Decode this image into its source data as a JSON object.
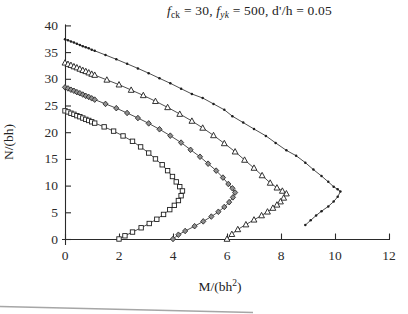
{
  "chart_data": {
    "type": "line",
    "title_plain": "fck = 30, fyk = 500, d'/h = 0.05",
    "title_segments": [
      {
        "text": "f",
        "italic": true
      },
      {
        "text": "ck",
        "sub": true
      },
      {
        "text": " = 30, "
      },
      {
        "text": "f",
        "italic": true
      },
      {
        "text": "yk",
        "sub": true,
        "italic": true
      },
      {
        "text": " = 500, d'/h = 0.05"
      }
    ],
    "ylabel": "N/(bh)",
    "xlabel_plain": "M/(bh2)",
    "xlabel_segments": [
      {
        "text": "M/(bh"
      },
      {
        "text": "2",
        "sup": true
      },
      {
        "text": ")"
      }
    ],
    "xlim": [
      0,
      12
    ],
    "ylim": [
      0,
      40
    ],
    "xticks": [
      0,
      2,
      4,
      6,
      8,
      10,
      12
    ],
    "yticks": [
      0,
      5,
      10,
      15,
      20,
      25,
      30,
      35,
      40
    ],
    "grid": false,
    "legend": "none",
    "axis_color": "#2a2a2a",
    "line_color": "#3a3a3a",
    "marker_outline": "#1e1e1e",
    "marker_fill_open": "#ffffff",
    "marker_fill_gray": "#8f8f8f",
    "series": [
      {
        "id": "curve-1",
        "marker": "square",
        "points": [
          [
            0,
            24
          ],
          [
            0.11,
            23.8
          ],
          [
            0.22,
            23.55
          ],
          [
            0.33,
            23.35
          ],
          [
            0.44,
            23.1
          ],
          [
            0.55,
            22.9
          ],
          [
            0.66,
            22.65
          ],
          [
            0.77,
            22.4
          ],
          [
            0.88,
            22.2
          ],
          [
            0.99,
            21.95
          ],
          [
            1.1,
            21.7
          ],
          [
            1.45,
            21
          ],
          [
            1.8,
            20.2
          ],
          [
            2.15,
            19.3
          ],
          [
            2.5,
            18.3
          ],
          [
            2.8,
            17.25
          ],
          [
            3.1,
            16.1
          ],
          [
            3.35,
            15
          ],
          [
            3.6,
            13.9
          ],
          [
            3.8,
            12.8
          ],
          [
            3.98,
            11.7
          ],
          [
            4.12,
            10.7
          ],
          [
            4.25,
            9.8
          ],
          [
            4.35,
            9
          ],
          [
            4.3,
            8.1
          ],
          [
            4.2,
            7.2
          ],
          [
            4.05,
            6.3
          ],
          [
            3.88,
            5.5
          ],
          [
            3.65,
            4.6
          ],
          [
            3.4,
            3.7
          ],
          [
            3.12,
            2.9
          ],
          [
            2.82,
            2.1
          ],
          [
            2.5,
            1.3
          ],
          [
            2.22,
            0.6
          ],
          [
            2,
            0
          ]
        ]
      },
      {
        "id": "curve-2",
        "marker": "diamond",
        "points": [
          [
            0,
            28.4
          ],
          [
            0.11,
            28.2
          ],
          [
            0.22,
            27.95
          ],
          [
            0.33,
            27.75
          ],
          [
            0.44,
            27.5
          ],
          [
            0.55,
            27.3
          ],
          [
            0.66,
            27.05
          ],
          [
            0.77,
            26.8
          ],
          [
            0.88,
            26.6
          ],
          [
            0.99,
            26.35
          ],
          [
            1.1,
            26.1
          ],
          [
            1.5,
            25.3
          ],
          [
            1.9,
            24.5
          ],
          [
            2.3,
            23.6
          ],
          [
            2.7,
            22.65
          ],
          [
            3.1,
            21.65
          ],
          [
            3.5,
            20.55
          ],
          [
            3.9,
            19.35
          ],
          [
            4.3,
            18.05
          ],
          [
            4.65,
            16.7
          ],
          [
            5,
            15.4
          ],
          [
            5.3,
            14.1
          ],
          [
            5.6,
            12.8
          ],
          [
            5.85,
            11.5
          ],
          [
            6.05,
            10.3
          ],
          [
            6.2,
            9.5
          ],
          [
            6.3,
            8.7
          ],
          [
            6.22,
            7.8
          ],
          [
            6.08,
            6.9
          ],
          [
            5.9,
            6
          ],
          [
            5.68,
            5.1
          ],
          [
            5.42,
            4.2
          ],
          [
            5.12,
            3.3
          ],
          [
            4.8,
            2.4
          ],
          [
            4.45,
            1.5
          ],
          [
            4.2,
            0.8
          ],
          [
            4,
            0
          ]
        ]
      },
      {
        "id": "curve-3",
        "marker": "triangle",
        "points": [
          [
            0,
            33
          ],
          [
            0.11,
            32.75
          ],
          [
            0.22,
            32.55
          ],
          [
            0.33,
            32.3
          ],
          [
            0.44,
            32.1
          ],
          [
            0.55,
            31.85
          ],
          [
            0.66,
            31.6
          ],
          [
            0.77,
            31.4
          ],
          [
            0.88,
            31.15
          ],
          [
            0.99,
            30.9
          ],
          [
            1.1,
            30.7
          ],
          [
            1.55,
            29.8
          ],
          [
            2,
            28.9
          ],
          [
            2.45,
            27.9
          ],
          [
            2.9,
            26.9
          ],
          [
            3.35,
            25.8
          ],
          [
            3.8,
            24.65
          ],
          [
            4.25,
            23.4
          ],
          [
            4.7,
            22.1
          ],
          [
            5.1,
            20.8
          ],
          [
            5.5,
            19.4
          ],
          [
            5.9,
            17.9
          ],
          [
            6.3,
            16.35
          ],
          [
            6.65,
            14.8
          ],
          [
            7,
            13.3
          ],
          [
            7.3,
            11.9
          ],
          [
            7.6,
            10.5
          ],
          [
            7.85,
            9.6
          ],
          [
            8.05,
            9
          ],
          [
            8.2,
            8.5
          ],
          [
            8.1,
            7.7
          ],
          [
            7.98,
            7
          ],
          [
            7.85,
            6.4
          ],
          [
            7.7,
            5.8
          ],
          [
            7.5,
            5.1
          ],
          [
            7.28,
            4.4
          ],
          [
            7,
            3.6
          ],
          [
            6.7,
            2.7
          ],
          [
            6.4,
            1.8
          ],
          [
            6.18,
            0.9
          ],
          [
            6,
            0
          ]
        ]
      },
      {
        "id": "curve-4",
        "marker": "dot",
        "points": [
          [
            0,
            37.4
          ],
          [
            0.11,
            37.2
          ],
          [
            0.22,
            37
          ],
          [
            0.33,
            36.8
          ],
          [
            0.44,
            36.55
          ],
          [
            0.55,
            36.35
          ],
          [
            0.66,
            36.1
          ],
          [
            0.77,
            35.9
          ],
          [
            0.88,
            35.7
          ],
          [
            0.99,
            35.45
          ],
          [
            1.1,
            35.25
          ],
          [
            1.5,
            34.45
          ],
          [
            1.9,
            33.65
          ],
          [
            2.3,
            32.8
          ],
          [
            2.7,
            31.95
          ],
          [
            3.1,
            31.05
          ],
          [
            3.5,
            30.1
          ],
          [
            3.9,
            29.15
          ],
          [
            4.3,
            28.15
          ],
          [
            4.7,
            27.15
          ],
          [
            5.1,
            26.4
          ],
          [
            5.5,
            25.3
          ],
          [
            5.9,
            24.2
          ],
          [
            6.2,
            23
          ],
          [
            6.6,
            21.8
          ],
          [
            7,
            20.6
          ],
          [
            7.44,
            19.3
          ],
          [
            7.8,
            18
          ],
          [
            8.2,
            16.6
          ],
          [
            8.56,
            15.6
          ],
          [
            8.9,
            14.3
          ],
          [
            9.2,
            13
          ],
          [
            9.5,
            11.8
          ],
          [
            9.75,
            10.7
          ],
          [
            9.95,
            9.8
          ],
          [
            10.1,
            9.3
          ],
          [
            10.2,
            8.9
          ],
          [
            10.1,
            7.9
          ],
          [
            9.95,
            7
          ],
          [
            9.75,
            6.1
          ],
          [
            9.5,
            5.2
          ],
          [
            9.3,
            4.4
          ],
          [
            9.1,
            3.5
          ],
          [
            8.9,
            2.6
          ]
        ]
      }
    ]
  }
}
